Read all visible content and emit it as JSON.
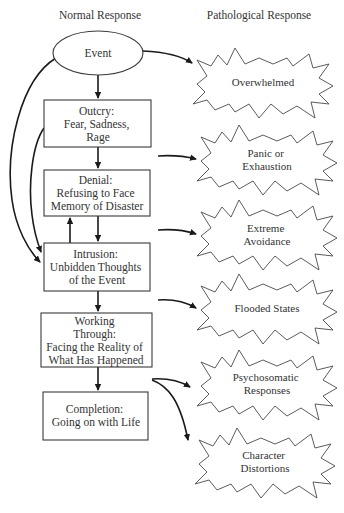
{
  "headers": {
    "normal": "Normal Response",
    "pathological": "Pathological Response"
  },
  "normal_nodes": [
    {
      "id": "event",
      "shape": "ellipse",
      "lines": [
        "Event"
      ]
    },
    {
      "id": "outcry",
      "shape": "box",
      "lines": [
        "Outcry:",
        "Fear, Sadness,",
        "Rage"
      ]
    },
    {
      "id": "denial",
      "shape": "box",
      "lines": [
        "Denial:",
        "Refusing to Face",
        "Memory of Disaster"
      ]
    },
    {
      "id": "intrusion",
      "shape": "box",
      "lines": [
        "Intrusion:",
        "Unbidden Thoughts",
        "of the Event"
      ]
    },
    {
      "id": "working_through",
      "shape": "box",
      "lines": [
        "Working",
        "Through:",
        "Facing the Reality of",
        "What Has Happened"
      ]
    },
    {
      "id": "completion",
      "shape": "box",
      "lines": [
        "Completion:",
        "Going on with Life"
      ]
    }
  ],
  "pathological_nodes": [
    {
      "id": "overwhelmed",
      "shape": "starburst",
      "lines": [
        "Overwhelmed"
      ]
    },
    {
      "id": "panic",
      "shape": "starburst",
      "lines": [
        "Panic or",
        "Exhaustion"
      ]
    },
    {
      "id": "avoidance",
      "shape": "starburst",
      "lines": [
        "Extreme",
        "Avoidance"
      ]
    },
    {
      "id": "flooded",
      "shape": "starburst",
      "lines": [
        "Flooded States"
      ]
    },
    {
      "id": "psychosomatic",
      "shape": "starburst",
      "lines": [
        "Psychosomatic",
        "Responses"
      ]
    },
    {
      "id": "character",
      "shape": "starburst",
      "lines": [
        "Character",
        "Distortions"
      ]
    }
  ],
  "edges": [
    {
      "from": "event",
      "to": "outcry"
    },
    {
      "from": "outcry",
      "to": "denial"
    },
    {
      "from": "denial",
      "to": "intrusion"
    },
    {
      "from": "intrusion",
      "to": "denial"
    },
    {
      "from": "intrusion",
      "to": "working_through"
    },
    {
      "from": "working_through",
      "to": "completion"
    },
    {
      "from": "event",
      "to": "intrusion"
    },
    {
      "from": "outcry",
      "to": "intrusion"
    },
    {
      "from": "event",
      "to": "overwhelmed"
    },
    {
      "from": "outcry",
      "to": "panic"
    },
    {
      "from": "denial",
      "to": "avoidance"
    },
    {
      "from": "intrusion",
      "to": "flooded"
    },
    {
      "from": "working_through",
      "to": "psychosomatic"
    },
    {
      "from": "working_through",
      "to": "character"
    }
  ]
}
